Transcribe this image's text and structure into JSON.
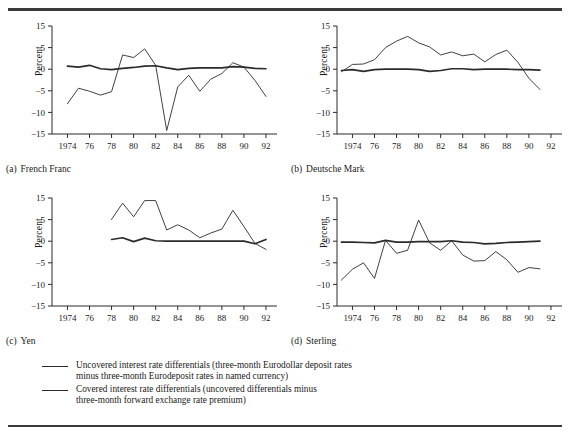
{
  "figure": {
    "y_axis_label": "Percent",
    "y_ticks": [
      15,
      5,
      0,
      -5,
      -10,
      -15
    ],
    "y_tick_labels": [
      "15",
      "5",
      "0",
      "-5",
      "-10",
      "-15"
    ],
    "x_ticks": [
      1974,
      1976,
      1978,
      1980,
      1982,
      1984,
      1986,
      1988,
      1990,
      1992
    ],
    "x_tick_labels": [
      "1974",
      "76",
      "78",
      "80",
      "82",
      "84",
      "86",
      "88",
      "90",
      "92"
    ],
    "x_range": [
      1972.6,
      1993.0
    ],
    "series_colors": {
      "uncovered": "#2b2b2b",
      "covered": "#2b2b2b"
    },
    "series_widths": {
      "uncovered": 0.9,
      "covered": 1.7
    }
  },
  "legend": {
    "position": "below",
    "entries": [
      {
        "swatch": "thin-line",
        "line1": "Uncovered interest rate differentials (three-month Eurodollar deposit rates",
        "line2": "minus three-month Eurodeposit rates in named currency)"
      },
      {
        "swatch": "thick-line",
        "line1": "Covered interest rate differentials (uncovered differentials minus",
        "line2": "three-month forward exchange rate premium)"
      }
    ]
  },
  "chart_data": [
    {
      "type": "line",
      "panel": "a",
      "tag": "(a)",
      "title": "French Franc",
      "xlabel": "",
      "ylabel": "Percent",
      "ylim": [
        -15,
        15
      ],
      "xlim": [
        1972.6,
        1993.0
      ],
      "grid": false,
      "x": [
        1974,
        1975,
        1976,
        1977,
        1978,
        1979,
        1980,
        1981,
        1982,
        1983,
        1984,
        1985,
        1986,
        1987,
        1988,
        1989,
        1990,
        1991,
        1992
      ],
      "series": [
        {
          "name": "Uncovered interest rate differentials",
          "style": "thin",
          "values": [
            -8.0,
            -4.4,
            -5.1,
            -6.0,
            -5.2,
            3.3,
            2.7,
            4.7,
            0.9,
            -14.2,
            -4.1,
            -1.4,
            -5.1,
            -2.3,
            -1.0,
            1.5,
            0.5,
            -2.6,
            -6.3
          ]
        },
        {
          "name": "Covered interest rate differentials",
          "style": "thick",
          "values": [
            0.7,
            0.5,
            0.9,
            0.1,
            -0.1,
            0.2,
            0.4,
            0.7,
            0.8,
            0.3,
            -0.1,
            0.2,
            0.3,
            0.3,
            0.3,
            0.6,
            0.5,
            0.2,
            0.1
          ]
        }
      ]
    },
    {
      "type": "line",
      "panel": "b",
      "tag": "(b)",
      "title": "Deutsche Mark",
      "xlabel": "",
      "ylabel": "Percent",
      "ylim": [
        -15,
        15
      ],
      "xlim": [
        1972.6,
        1993.0
      ],
      "grid": false,
      "x": [
        1973,
        1974,
        1975,
        1976,
        1977,
        1978,
        1979,
        1980,
        1981,
        1982,
        1983,
        1984,
        1985,
        1986,
        1987,
        1988,
        1989,
        1990,
        1991
      ],
      "series": [
        {
          "name": "Uncovered interest rate differentials",
          "style": "thin",
          "values": [
            -0.6,
            1.1,
            1.2,
            2.2,
            5.0,
            8.0,
            10.2,
            7.2,
            5.3,
            3.3,
            4.0,
            3.1,
            3.5,
            1.7,
            3.4,
            4.4,
            1.6,
            -2.1,
            -4.7
          ]
        },
        {
          "name": "Covered interest rate differentials",
          "style": "thick",
          "values": [
            -0.3,
            -0.1,
            -0.5,
            -0.1,
            0.0,
            0.0,
            0.0,
            -0.1,
            -0.5,
            -0.3,
            0.1,
            0.1,
            -0.1,
            0.0,
            0.0,
            0.0,
            -0.1,
            -0.1,
            -0.2
          ]
        }
      ]
    },
    {
      "type": "line",
      "panel": "c",
      "tag": "(c)",
      "title": "Yen",
      "xlabel": "",
      "ylabel": "Percent",
      "ylim": [
        -15,
        15
      ],
      "xlim": [
        1972.6,
        1993.0
      ],
      "grid": false,
      "x": [
        1978,
        1979,
        1980,
        1981,
        1982,
        1983,
        1984,
        1985,
        1986,
        1987,
        1988,
        1989,
        1990,
        1991,
        1992
      ],
      "series": [
        {
          "name": "Uncovered interest rate differentials",
          "style": "thin",
          "values": [
            5.1,
            12.6,
            6.3,
            13.8,
            13.8,
            2.6,
            3.8,
            2.6,
            0.8,
            1.9,
            2.8,
            9.3,
            3.4,
            -0.5,
            -1.9
          ]
        },
        {
          "name": "Covered interest rate differentials",
          "style": "thick",
          "values": [
            0.4,
            0.8,
            -0.1,
            0.7,
            0.1,
            0.0,
            0.0,
            0.0,
            0.0,
            0.0,
            0.0,
            0.0,
            0.0,
            -0.6,
            0.4
          ]
        }
      ]
    },
    {
      "type": "line",
      "panel": "d",
      "tag": "(d)",
      "title": "Sterling",
      "xlabel": "",
      "ylabel": "Percent",
      "ylim": [
        -15,
        15
      ],
      "xlim": [
        1972.6,
        1993.0
      ],
      "grid": false,
      "x": [
        1973,
        1974,
        1975,
        1976,
        1977,
        1978,
        1979,
        1980,
        1981,
        1982,
        1983,
        1984,
        1985,
        1986,
        1987,
        1988,
        1989,
        1990,
        1991
      ],
      "series": [
        {
          "name": "Uncovered interest rate differentials",
          "style": "thin",
          "values": [
            -9.0,
            -6.5,
            -5.0,
            -8.6,
            0.2,
            -2.8,
            -2.1,
            4.9,
            -0.4,
            -2.1,
            0.1,
            -3.2,
            -4.6,
            -4.5,
            -2.4,
            -4.3,
            -7.2,
            -6.1,
            -6.4
          ]
        },
        {
          "name": "Covered interest rate differentials",
          "style": "thick",
          "values": [
            -0.2,
            -0.2,
            -0.3,
            -0.4,
            0.2,
            -0.2,
            -0.2,
            -0.1,
            -0.1,
            -0.1,
            0.1,
            -0.2,
            -0.3,
            -0.6,
            -0.5,
            -0.3,
            -0.2,
            -0.1,
            0.0
          ]
        }
      ]
    }
  ]
}
